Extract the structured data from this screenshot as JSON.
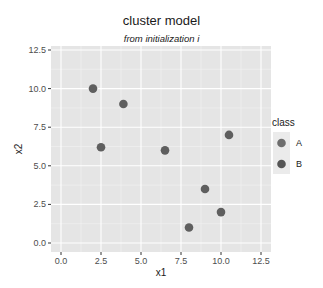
{
  "chart_data": {
    "type": "scatter",
    "title": "cluster model",
    "subtitle": "from initialization i",
    "xlabel": "x1",
    "ylabel": "x2",
    "xlim": [
      -0.6,
      12.5
    ],
    "ylim": [
      -0.6,
      12.5
    ],
    "xticks": [
      "0.0",
      "2.5",
      "5.0",
      "7.5",
      "10.0",
      "12.5"
    ],
    "yticks": [
      "0.0",
      "2.5",
      "5.0",
      "7.5",
      "10.0",
      "12.5"
    ],
    "grid": true,
    "legend": {
      "title": "class",
      "position": "right",
      "entries": [
        {
          "label": "A",
          "color": "#6e6e6e"
        },
        {
          "label": "B",
          "color": "#555555"
        }
      ]
    },
    "points": [
      {
        "x": 2.0,
        "y": 10.0
      },
      {
        "x": 3.9,
        "y": 9.0
      },
      {
        "x": 2.5,
        "y": 6.2
      },
      {
        "x": 6.5,
        "y": 6.0
      },
      {
        "x": 10.5,
        "y": 7.0
      },
      {
        "x": 9.0,
        "y": 3.5
      },
      {
        "x": 10.0,
        "y": 2.0
      },
      {
        "x": 8.0,
        "y": 1.0
      }
    ],
    "point_color": "#5f5f5f",
    "panel_background": "#e5e5e5",
    "grid_color": "#ffffff"
  }
}
